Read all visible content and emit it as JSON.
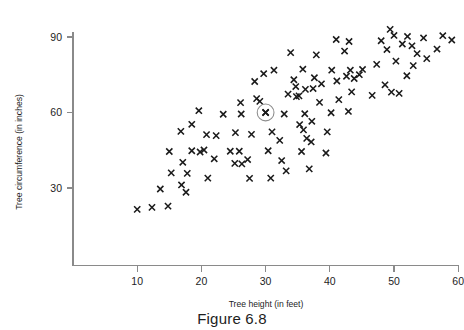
{
  "figure": {
    "caption": "Figure 6.8"
  },
  "chart_data": {
    "type": "scatter",
    "title": "",
    "xlabel": "Tree height (in feet)",
    "ylabel": "Tree circumference (in inches)",
    "xlim": [
      0,
      60
    ],
    "ylim": [
      0,
      96
    ],
    "grid": false,
    "legend": "none",
    "marker": "x",
    "xticks": [
      10,
      20,
      30,
      40,
      50,
      60
    ],
    "yticks": [
      30,
      60,
      90
    ],
    "highlight": {
      "x": 30,
      "y": 60,
      "style": "circled",
      "label": ""
    },
    "points": [
      [
        10.0,
        21.5
      ],
      [
        12.3,
        22.3
      ],
      [
        14.8,
        22.8
      ],
      [
        13.6,
        29.6
      ],
      [
        17.6,
        28.3
      ],
      [
        16.9,
        31.2
      ],
      [
        15.3,
        36.0
      ],
      [
        17.8,
        35.8
      ],
      [
        15.0,
        44.5
      ],
      [
        17.1,
        40.2
      ],
      [
        18.5,
        44.8
      ],
      [
        19.8,
        44.3
      ],
      [
        20.4,
        45.1
      ],
      [
        16.8,
        52.5
      ],
      [
        18.5,
        55.3
      ],
      [
        19.6,
        60.7
      ],
      [
        20.8,
        51.2
      ],
      [
        21.0,
        33.9
      ],
      [
        22.3,
        50.8
      ],
      [
        22.0,
        41.6
      ],
      [
        23.4,
        59.3
      ],
      [
        24.5,
        44.6
      ],
      [
        25.2,
        39.8
      ],
      [
        25.9,
        44.6
      ],
      [
        25.3,
        52.0
      ],
      [
        26.2,
        59.4
      ],
      [
        26.3,
        39.6
      ],
      [
        26.1,
        63.9
      ],
      [
        27.5,
        33.8
      ],
      [
        27.2,
        41.3
      ],
      [
        27.8,
        51.3
      ],
      [
        28.6,
        65.5
      ],
      [
        28.3,
        72.3
      ],
      [
        29.1,
        64.4
      ],
      [
        29.7,
        75.4
      ],
      [
        30.0,
        60.0
      ],
      [
        30.8,
        33.9
      ],
      [
        30.4,
        44.8
      ],
      [
        31.0,
        52.3
      ],
      [
        31.3,
        76.8
      ],
      [
        32.5,
        40.9
      ],
      [
        32.2,
        48.9
      ],
      [
        32.9,
        59.4
      ],
      [
        33.5,
        67.3
      ],
      [
        33.2,
        36.8
      ],
      [
        33.9,
        83.8
      ],
      [
        34.4,
        73.0
      ],
      [
        34.7,
        70.3
      ],
      [
        34.8,
        66.3
      ],
      [
        35.2,
        66.6
      ],
      [
        35.6,
        44.5
      ],
      [
        35.3,
        55.2
      ],
      [
        35.9,
        53.1
      ],
      [
        35.8,
        77.2
      ],
      [
        36.1,
        59.5
      ],
      [
        36.4,
        49.7
      ],
      [
        36.2,
        69.2
      ],
      [
        36.8,
        37.6
      ],
      [
        37.1,
        48.3
      ],
      [
        37.2,
        56.5
      ],
      [
        37.4,
        69.5
      ],
      [
        37.6,
        73.8
      ],
      [
        37.9,
        82.9
      ],
      [
        38.4,
        64.0
      ],
      [
        38.7,
        71.4
      ],
      [
        39.4,
        43.9
      ],
      [
        39.6,
        52.3
      ],
      [
        40.2,
        59.9
      ],
      [
        40.3,
        76.8
      ],
      [
        41.0,
        89.0
      ],
      [
        41.1,
        72.5
      ],
      [
        41.4,
        65.1
      ],
      [
        42.3,
        84.4
      ],
      [
        42.6,
        74.4
      ],
      [
        42.9,
        60.4
      ],
      [
        43.0,
        88.2
      ],
      [
        43.2,
        76.8
      ],
      [
        43.4,
        68.2
      ],
      [
        43.8,
        73.5
      ],
      [
        44.6,
        75.0
      ],
      [
        45.1,
        77.1
      ],
      [
        46.6,
        66.8
      ],
      [
        47.3,
        79.1
      ],
      [
        48.0,
        88.5
      ],
      [
        48.6,
        71.0
      ],
      [
        48.9,
        85.0
      ],
      [
        49.4,
        93.0
      ],
      [
        49.6,
        68.1
      ],
      [
        50.0,
        90.6
      ],
      [
        50.3,
        80.4
      ],
      [
        50.8,
        67.6
      ],
      [
        51.3,
        87.2
      ],
      [
        52.0,
        74.6
      ],
      [
        52.1,
        90.2
      ],
      [
        52.8,
        86.5
      ],
      [
        53.0,
        78.6
      ],
      [
        53.6,
        83.4
      ],
      [
        54.6,
        89.6
      ],
      [
        55.1,
        81.4
      ],
      [
        56.7,
        85.2
      ],
      [
        57.6,
        90.5
      ],
      [
        59.0,
        88.8
      ]
    ]
  }
}
